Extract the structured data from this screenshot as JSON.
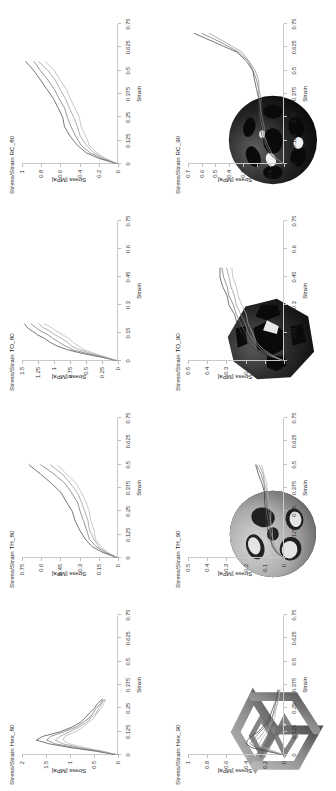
{
  "figure": {
    "orientation": "rotated-90",
    "axis_label_x": "Strain",
    "axis_label_y": "Stress [MPa]"
  },
  "panels": [
    {
      "id": "hex",
      "specimen_name": "hex-lattice-specimen",
      "specimen_color": "#8b8b8b",
      "plots": [
        {
          "title": "Stress/Strain Hex_80",
          "xlabel": "Strain",
          "ylabel": "Stress [MPa]",
          "xticks": [
            "0",
            "0.125",
            "0.25",
            "0.375",
            "0.5",
            "0.625",
            "0.75"
          ],
          "yticks": [
            "0",
            "0.5",
            "1",
            "1.5",
            "2"
          ]
        },
        {
          "title": "Stress/Strain Hex_90",
          "xlabel": "Strain",
          "ylabel": "Stress [MPa]",
          "xticks": [
            "0",
            "0.125",
            "0.25",
            "0.375",
            "0.5",
            "0.625",
            "0.75"
          ],
          "yticks": [
            "0",
            "0.2",
            "0.4",
            "0.6",
            "0.8",
            "1"
          ]
        }
      ]
    },
    {
      "id": "th",
      "specimen_name": "th-lattice-specimen",
      "specimen_color": "#a9a9a9",
      "plots": [
        {
          "title": "Stress/Strain TH_80",
          "xlabel": "Strain",
          "ylabel": "Stress [MPa]",
          "xticks": [
            "0",
            "0.125",
            "0.25",
            "0.375",
            "0.5",
            "0.625",
            "0.75"
          ],
          "yticks": [
            "0",
            "0.15",
            "0.3",
            "0.45",
            "0.6",
            "0.75"
          ]
        },
        {
          "title": "Stress/Strain TH_90",
          "xlabel": "Strain",
          "ylabel": "Stress [MPa]",
          "xticks": [
            "0",
            "0.125",
            "0.25",
            "0.375",
            "0.5",
            "0.625",
            "0.75"
          ],
          "yticks": [
            "0",
            "0.1",
            "0.2",
            "0.3",
            "0.4",
            "0.5"
          ]
        }
      ]
    },
    {
      "id": "to",
      "specimen_name": "to-lattice-specimen",
      "specimen_color": "#2b2b2b",
      "plots": [
        {
          "title": "Stress/Strain TO_80",
          "xlabel": "Strain",
          "ylabel": "Stress [MPa]",
          "xticks": [
            "0",
            "0.15",
            "0.3",
            "0.45",
            "0.6",
            "0.75"
          ],
          "yticks": [
            "0",
            "0.25",
            "0.5",
            "0.75",
            "1",
            "1.25",
            "1.5"
          ]
        },
        {
          "title": "Stress/Strain TO_90",
          "xlabel": "Strain",
          "ylabel": "Stress [MPa]",
          "xticks": [
            "0",
            "0.15",
            "0.3",
            "0.45",
            "0.6",
            "0.75"
          ],
          "yticks": [
            "0",
            "0.1",
            "0.2",
            "0.3",
            "0.4",
            "0.5"
          ]
        }
      ]
    },
    {
      "id": "rc",
      "specimen_name": "rc-lattice-specimen",
      "specimen_color": "#242424",
      "plots": [
        {
          "title": "Stress/Strain RC_80",
          "xlabel": "Strain",
          "ylabel": "Stress [MPa]",
          "xticks": [
            "0",
            "0.125",
            "0.25",
            "0.375",
            "0.5",
            "0.625",
            "0.75"
          ],
          "yticks": [
            "0",
            "0.2",
            "0.4",
            "0.6",
            "0.8",
            "1"
          ]
        },
        {
          "title": "Stress/Strain RC_90",
          "xlabel": "Strain",
          "ylabel": "Stress [MPa]",
          "xticks": [
            "0",
            "0.125",
            "0.25",
            "0.375",
            "0.5",
            "0.625",
            "0.75"
          ],
          "yticks": [
            "0",
            "0.1",
            "0.2",
            "0.3",
            "0.4",
            "0.5",
            "0.6",
            "0.7"
          ]
        }
      ]
    }
  ],
  "chart_data": [
    {
      "type": "line",
      "title": "Stress/Strain Hex_80",
      "xlabel": "Strain",
      "ylabel": "Stress [MPa]",
      "xlim": [
        0,
        0.75
      ],
      "ylim": [
        0,
        2
      ],
      "xticks": [
        0,
        0.125,
        0.25,
        0.375,
        0.5,
        0.625,
        0.75
      ],
      "yticks": [
        0,
        0.5,
        1,
        1.5,
        2
      ],
      "grid": false,
      "legend": "none",
      "x": [
        0,
        0.02,
        0.04,
        0.06,
        0.08,
        0.1,
        0.125,
        0.15,
        0.175,
        0.2,
        0.225,
        0.25,
        0.275,
        0.3
      ],
      "series": [
        {
          "name": "specimen 1",
          "values": [
            0,
            0.45,
            1.0,
            1.45,
            1.7,
            1.55,
            1.2,
            0.95,
            0.8,
            0.68,
            0.58,
            0.5,
            0.42,
            0.34
          ]
        },
        {
          "name": "specimen 2",
          "values": [
            0,
            0.4,
            0.9,
            1.3,
            1.5,
            1.4,
            1.1,
            0.88,
            0.72,
            0.6,
            0.52,
            0.44,
            0.37,
            0.3
          ]
        },
        {
          "name": "specimen 3",
          "values": [
            0,
            0.35,
            0.8,
            1.15,
            1.3,
            1.22,
            1.0,
            0.8,
            0.66,
            0.55,
            0.47,
            0.4,
            0.33,
            0.27
          ]
        },
        {
          "name": "specimen 4",
          "values": [
            0,
            0.3,
            0.7,
            1.0,
            1.15,
            1.1,
            0.9,
            0.72,
            0.6,
            0.5,
            0.43,
            0.36,
            0.3,
            0.24
          ]
        }
      ]
    },
    {
      "type": "line",
      "title": "Stress/Strain Hex_90",
      "xlabel": "Strain",
      "ylabel": "Stress [MPa]",
      "xlim": [
        0,
        0.75
      ],
      "ylim": [
        0,
        1
      ],
      "xticks": [
        0,
        0.125,
        0.25,
        0.375,
        0.5,
        0.625,
        0.75
      ],
      "yticks": [
        0,
        0.2,
        0.4,
        0.6,
        0.8,
        1
      ],
      "grid": false,
      "legend": "none",
      "x": [
        0,
        0.02,
        0.04,
        0.06,
        0.08,
        0.1,
        0.125,
        0.15,
        0.175,
        0.2,
        0.25,
        0.3,
        0.35
      ],
      "series": [
        {
          "name": "specimen 1",
          "values": [
            0,
            0.18,
            0.34,
            0.4,
            0.38,
            0.33,
            0.27,
            0.22,
            0.18,
            0.15,
            0.11,
            0.08,
            0.06
          ]
        },
        {
          "name": "specimen 2",
          "values": [
            0,
            0.15,
            0.29,
            0.35,
            0.33,
            0.29,
            0.24,
            0.2,
            0.16,
            0.13,
            0.1,
            0.07,
            0.05
          ]
        },
        {
          "name": "specimen 3",
          "values": [
            0,
            0.12,
            0.24,
            0.3,
            0.29,
            0.25,
            0.21,
            0.17,
            0.14,
            0.12,
            0.09,
            0.06,
            0.05
          ]
        },
        {
          "name": "specimen 4",
          "values": [
            0,
            0.1,
            0.2,
            0.25,
            0.24,
            0.21,
            0.18,
            0.15,
            0.12,
            0.1,
            0.08,
            0.06,
            0.04
          ]
        }
      ]
    },
    {
      "type": "line",
      "title": "Stress/Strain TH_80",
      "xlabel": "Strain",
      "ylabel": "Stress [MPa]",
      "xlim": [
        0,
        0.75
      ],
      "ylim": [
        0,
        0.75
      ],
      "xticks": [
        0,
        0.125,
        0.25,
        0.375,
        0.5,
        0.625,
        0.75
      ],
      "yticks": [
        0,
        0.15,
        0.3,
        0.45,
        0.6,
        0.75
      ],
      "grid": false,
      "legend": "none",
      "x": [
        0,
        0.03,
        0.06,
        0.1,
        0.15,
        0.2,
        0.25,
        0.3,
        0.35,
        0.4,
        0.45,
        0.5
      ],
      "series": [
        {
          "name": "specimen 1",
          "values": [
            0,
            0.12,
            0.2,
            0.26,
            0.3,
            0.33,
            0.36,
            0.4,
            0.45,
            0.52,
            0.6,
            0.7
          ]
        },
        {
          "name": "specimen 2",
          "values": [
            0,
            0.1,
            0.17,
            0.22,
            0.25,
            0.27,
            0.29,
            0.32,
            0.36,
            0.42,
            0.5,
            0.6
          ]
        },
        {
          "name": "specimen 3",
          "values": [
            0,
            0.09,
            0.15,
            0.19,
            0.22,
            0.24,
            0.26,
            0.28,
            0.32,
            0.37,
            0.44,
            0.53
          ]
        },
        {
          "name": "specimen 4",
          "values": [
            0,
            0.08,
            0.13,
            0.17,
            0.19,
            0.21,
            0.23,
            0.25,
            0.28,
            0.33,
            0.4,
            0.48
          ]
        }
      ]
    },
    {
      "type": "line",
      "title": "Stress/Strain TH_90",
      "xlabel": "Strain",
      "ylabel": "Stress [MPa]",
      "xlim": [
        0,
        0.75
      ],
      "ylim": [
        0,
        0.5
      ],
      "xticks": [
        0,
        0.125,
        0.25,
        0.375,
        0.5,
        0.625,
        0.75
      ],
      "yticks": [
        0,
        0.1,
        0.2,
        0.3,
        0.4,
        0.5
      ],
      "grid": false,
      "legend": "none",
      "x": [
        0,
        0.03,
        0.06,
        0.1,
        0.15,
        0.2,
        0.25,
        0.3,
        0.35,
        0.4,
        0.45,
        0.5
      ],
      "series": [
        {
          "name": "specimen 1",
          "values": [
            0,
            0.04,
            0.06,
            0.075,
            0.085,
            0.09,
            0.095,
            0.1,
            0.105,
            0.115,
            0.13,
            0.15
          ]
        },
        {
          "name": "specimen 2",
          "values": [
            0,
            0.035,
            0.055,
            0.068,
            0.078,
            0.082,
            0.088,
            0.092,
            0.098,
            0.108,
            0.12,
            0.14
          ]
        },
        {
          "name": "specimen 3",
          "values": [
            0,
            0.03,
            0.05,
            0.06,
            0.07,
            0.075,
            0.08,
            0.085,
            0.09,
            0.1,
            0.112,
            0.13
          ]
        },
        {
          "name": "specimen 4",
          "values": [
            0,
            0.028,
            0.045,
            0.055,
            0.063,
            0.068,
            0.072,
            0.077,
            0.083,
            0.092,
            0.103,
            0.12
          ]
        }
      ]
    },
    {
      "type": "line",
      "title": "Stress/Strain TO_80",
      "xlabel": "Strain",
      "ylabel": "Stress [MPa]",
      "xlim": [
        0,
        0.75
      ],
      "ylim": [
        0,
        1.5
      ],
      "xticks": [
        0,
        0.15,
        0.3,
        0.45,
        0.6,
        0.75
      ],
      "yticks": [
        0,
        0.25,
        0.5,
        0.75,
        1,
        1.25,
        1.5
      ],
      "grid": false,
      "legend": "none",
      "x": [
        0,
        0.02,
        0.04,
        0.06,
        0.08,
        0.1,
        0.12,
        0.14,
        0.16,
        0.18,
        0.2
      ],
      "series": [
        {
          "name": "specimen 1",
          "values": [
            0,
            0.25,
            0.55,
            0.8,
            0.95,
            1.05,
            1.15,
            1.25,
            1.35,
            1.42,
            1.45
          ]
        },
        {
          "name": "specimen 2",
          "values": [
            0,
            0.22,
            0.48,
            0.7,
            0.83,
            0.92,
            1.0,
            1.1,
            1.2,
            1.3,
            1.36
          ]
        },
        {
          "name": "specimen 3",
          "values": [
            0,
            0.2,
            0.42,
            0.6,
            0.72,
            0.8,
            0.88,
            0.97,
            1.07,
            1.17,
            1.25
          ]
        },
        {
          "name": "specimen 4",
          "values": [
            0,
            0.18,
            0.36,
            0.52,
            0.62,
            0.7,
            0.78,
            0.86,
            0.95,
            1.05,
            1.15
          ]
        }
      ]
    },
    {
      "type": "line",
      "title": "Stress/Strain TO_90",
      "xlabel": "Strain",
      "ylabel": "Stress [MPa]",
      "xlim": [
        0,
        0.75
      ],
      "ylim": [
        0,
        0.5
      ],
      "xticks": [
        0,
        0.15,
        0.3,
        0.45,
        0.6,
        0.75
      ],
      "yticks": [
        0,
        0.1,
        0.2,
        0.3,
        0.4,
        0.5
      ],
      "grid": false,
      "legend": "none",
      "x": [
        0,
        0.03,
        0.06,
        0.1,
        0.15,
        0.2,
        0.25,
        0.3,
        0.35,
        0.4,
        0.45,
        0.5
      ],
      "series": [
        {
          "name": "specimen 1",
          "values": [
            0,
            0.09,
            0.15,
            0.19,
            0.22,
            0.24,
            0.26,
            0.285,
            0.3,
            0.32,
            0.33,
            0.335
          ]
        },
        {
          "name": "specimen 2",
          "values": [
            0,
            0.08,
            0.135,
            0.175,
            0.205,
            0.225,
            0.245,
            0.265,
            0.285,
            0.3,
            0.315,
            0.32
          ]
        },
        {
          "name": "specimen 3",
          "values": [
            0,
            0.07,
            0.12,
            0.155,
            0.185,
            0.205,
            0.225,
            0.245,
            0.26,
            0.275,
            0.29,
            0.3
          ]
        },
        {
          "name": "specimen 4",
          "values": [
            0,
            0.06,
            0.105,
            0.14,
            0.165,
            0.185,
            0.2,
            0.22,
            0.235,
            0.25,
            0.265,
            0.275
          ]
        }
      ]
    },
    {
      "type": "line",
      "title": "Stress/Strain RC_80",
      "xlabel": "Strain",
      "ylabel": "Stress [MPa]",
      "xlim": [
        0,
        0.75
      ],
      "ylim": [
        0,
        1
      ],
      "xticks": [
        0,
        0.125,
        0.25,
        0.375,
        0.5,
        0.625,
        0.75
      ],
      "yticks": [
        0,
        0.2,
        0.4,
        0.6,
        0.8,
        1
      ],
      "grid": false,
      "legend": "none",
      "x": [
        0,
        0.03,
        0.06,
        0.1,
        0.15,
        0.2,
        0.25,
        0.3,
        0.35,
        0.4,
        0.45,
        0.5,
        0.55
      ],
      "series": [
        {
          "name": "specimen 1",
          "values": [
            0,
            0.2,
            0.33,
            0.43,
            0.5,
            0.55,
            0.58,
            0.62,
            0.68,
            0.74,
            0.8,
            0.88,
            0.96
          ]
        },
        {
          "name": "specimen 2",
          "values": [
            0,
            0.17,
            0.29,
            0.38,
            0.45,
            0.49,
            0.52,
            0.56,
            0.61,
            0.67,
            0.73,
            0.8,
            0.88
          ]
        },
        {
          "name": "specimen 3",
          "values": [
            0,
            0.15,
            0.25,
            0.33,
            0.39,
            0.43,
            0.46,
            0.5,
            0.55,
            0.6,
            0.66,
            0.73,
            0.82
          ]
        },
        {
          "name": "specimen 4",
          "values": [
            0,
            0.13,
            0.22,
            0.29,
            0.34,
            0.38,
            0.41,
            0.45,
            0.49,
            0.54,
            0.6,
            0.67,
            0.76
          ]
        }
      ]
    },
    {
      "type": "line",
      "title": "Stress/Strain RC_90",
      "xlabel": "Strain",
      "ylabel": "Stress [MPa]",
      "xlim": [
        0,
        0.75
      ],
      "ylim": [
        0,
        0.7
      ],
      "xticks": [
        0,
        0.125,
        0.25,
        0.375,
        0.5,
        0.625,
        0.75
      ],
      "yticks": [
        0,
        0.1,
        0.2,
        0.3,
        0.4,
        0.5,
        0.6,
        0.7
      ],
      "grid": false,
      "legend": "none",
      "x": [
        0,
        0.03,
        0.06,
        0.1,
        0.15,
        0.2,
        0.25,
        0.3,
        0.35,
        0.4,
        0.45,
        0.5,
        0.55,
        0.6,
        0.65,
        0.7
      ],
      "series": [
        {
          "name": "specimen 1",
          "values": [
            0,
            0.07,
            0.11,
            0.14,
            0.16,
            0.17,
            0.18,
            0.185,
            0.19,
            0.2,
            0.21,
            0.23,
            0.27,
            0.35,
            0.5,
            0.65
          ]
        },
        {
          "name": "specimen 2",
          "values": [
            0,
            0.06,
            0.1,
            0.13,
            0.15,
            0.16,
            0.17,
            0.175,
            0.18,
            0.19,
            0.2,
            0.22,
            0.26,
            0.33,
            0.46,
            0.6
          ]
        },
        {
          "name": "specimen 3",
          "values": [
            0,
            0.055,
            0.09,
            0.12,
            0.14,
            0.15,
            0.16,
            0.165,
            0.17,
            0.18,
            0.19,
            0.21,
            0.25,
            0.31,
            0.42,
            0.55
          ]
        }
      ]
    }
  ]
}
